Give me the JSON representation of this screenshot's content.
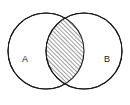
{
  "figure": {
    "background_color": "#ffffff",
    "stroke_color": "#1a1a1a",
    "shade_color": "#222222",
    "width": 130,
    "height": 105
  },
  "sets": [
    {
      "id": "set-a",
      "label": "A",
      "label_x": 25,
      "label_y": 60,
      "circle_cx": 46,
      "circle_cy": 51,
      "circle_r": 38
    },
    {
      "id": "set-b",
      "label": "B",
      "label_x": 107,
      "label_y": 60,
      "circle_cx": 84,
      "circle_cy": 51,
      "circle_r": 38
    }
  ],
  "region": {
    "name": "intersection",
    "fill_style": "diagonal-hatch",
    "hatch_angle_degrees": 45,
    "hatch_spacing_px": 3,
    "hatch_stroke_width_px": 0.9,
    "top_vertex_x": 65,
    "top_vertex_y": 6,
    "bottom_vertex_x": 65,
    "bottom_vertex_y": 96
  },
  "chart_data": {
    "type": "diagram",
    "subtype": "venn-2set",
    "title": "",
    "sets": [
      "A",
      "B"
    ],
    "shaded_regions": [
      "A∩B"
    ],
    "unshaded_regions": [
      "A\\B",
      "B\\A"
    ],
    "legend": null,
    "annotations": [
      {
        "text": "A",
        "x": 25,
        "y": 60
      },
      {
        "text": "B",
        "x": 107,
        "y": 60
      }
    ]
  }
}
